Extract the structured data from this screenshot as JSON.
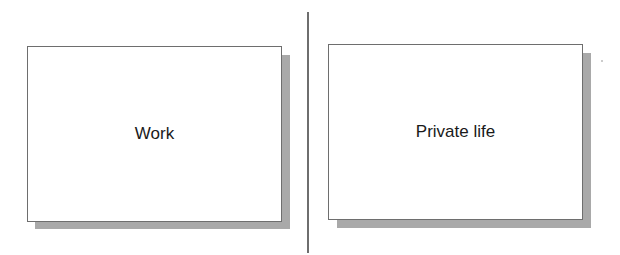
{
  "diagram": {
    "left_box": {
      "label": "Work"
    },
    "right_box": {
      "label": "Private life"
    }
  },
  "colors": {
    "border": "#6e6e6e",
    "shadow": "#a9a9a9",
    "background": "#ffffff",
    "text": "#1a1a1a"
  }
}
